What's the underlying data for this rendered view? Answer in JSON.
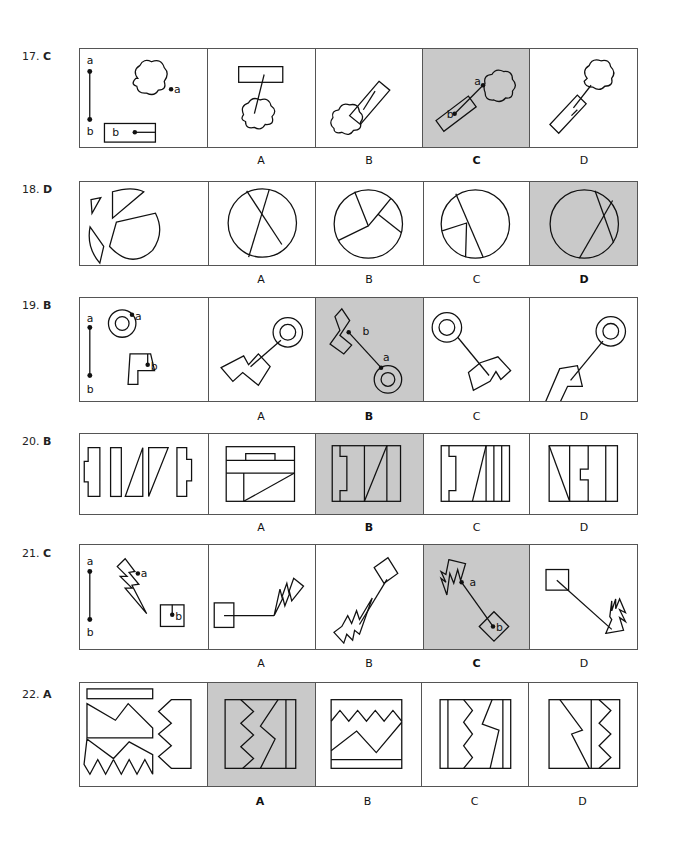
{
  "questions": [
    {
      "number": "17.",
      "answer": "C",
      "options": [
        "A",
        "B",
        "C",
        "D"
      ],
      "selected": "C",
      "figure_desc": "Segment a–b connecting a cloud (point a) to a rectangle (point b)"
    },
    {
      "number": "18.",
      "answer": "D",
      "options": [
        "A",
        "B",
        "C",
        "D"
      ],
      "selected": "D",
      "figure_desc": "Four circle pieces to be assembled into a whole circle"
    },
    {
      "number": "19.",
      "answer": "B",
      "options": [
        "A",
        "B",
        "C",
        "D"
      ],
      "selected": "B",
      "figure_desc": "Segment a–b connecting a ring (point a) to a polygon (point b)"
    },
    {
      "number": "20.",
      "answer": "B",
      "options": [
        "A",
        "B",
        "C",
        "D"
      ],
      "selected": "B",
      "figure_desc": "Five pieces to be assembled into a rectangle"
    },
    {
      "number": "21.",
      "answer": "C",
      "options": [
        "A",
        "B",
        "C",
        "D"
      ],
      "selected": "C",
      "figure_desc": "Segment a–b connecting a lightning bolt (point a) to a square (point b)"
    },
    {
      "number": "22.",
      "answer": "A",
      "options": [
        "A",
        "B",
        "C",
        "D"
      ],
      "selected": "A",
      "figure_desc": "Four zigzag pieces to be assembled into a square"
    }
  ],
  "point_labels": {
    "a": "a",
    "b": "b"
  },
  "colors": {
    "selected_bg": "#c9c9c9",
    "border": "#555555",
    "ink": "#111111"
  }
}
